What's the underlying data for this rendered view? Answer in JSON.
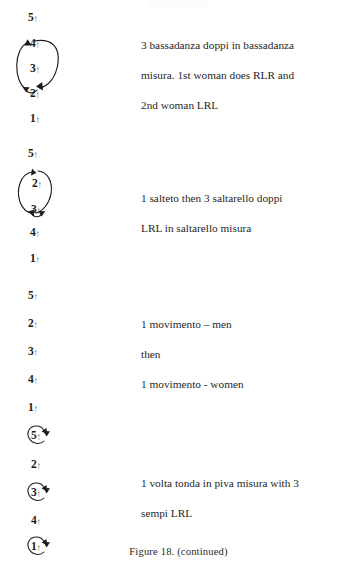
{
  "figure": {
    "caption": "Figure 18. (continued)",
    "facing_mark": "↑"
  },
  "groups": [
    {
      "id": "group-1",
      "dancers": [
        {
          "label": "5",
          "facing": "↑"
        },
        {
          "label": "4",
          "facing": "↑"
        },
        {
          "label": "3",
          "facing": "↑"
        },
        {
          "label": "2",
          "facing": "↑"
        },
        {
          "label": "1",
          "facing": "↑"
        }
      ],
      "path_type": "wide-ellipse-loop",
      "description": [
        "3 bassadanza doppi in bassadanza",
        "misura. 1st woman does RLR and",
        "2nd woman LRL"
      ]
    },
    {
      "id": "group-2",
      "dancers": [
        {
          "label": "5",
          "facing": "↑"
        },
        {
          "label": "2",
          "facing": "↑"
        },
        {
          "label": "3",
          "facing": "↑"
        },
        {
          "label": "4",
          "facing": "↑"
        },
        {
          "label": "1",
          "facing": "↑"
        }
      ],
      "path_type": "narrow-oval-loop",
      "description": [
        "1 salteto then 3 saltarello doppi",
        "LRL in saltarello misura"
      ]
    },
    {
      "id": "group-3",
      "dancers": [
        {
          "label": "5",
          "facing": "↑"
        },
        {
          "label": "2",
          "facing": "↑"
        },
        {
          "label": "3",
          "facing": "↑"
        },
        {
          "label": "4",
          "facing": "↑"
        },
        {
          "label": "1",
          "facing": "↑"
        }
      ],
      "path_type": "none",
      "description": [
        "1 movimento – men",
        "then",
        "1 movimento - women"
      ]
    },
    {
      "id": "group-4",
      "dancers": [
        {
          "label": "5",
          "facing": "↑",
          "turn": true
        },
        {
          "label": "2",
          "facing": "↑",
          "turn": false
        },
        {
          "label": "3",
          "facing": "↑",
          "turn": true
        },
        {
          "label": "4",
          "facing": "↑",
          "turn": false
        },
        {
          "label": "1",
          "facing": "↑",
          "turn": true
        }
      ],
      "path_type": "individual-turns",
      "description": [
        "1 volta tonda in piva misura with 3",
        "sempi LRL"
      ]
    }
  ]
}
